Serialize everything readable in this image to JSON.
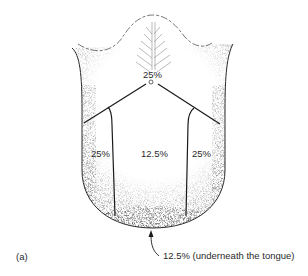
{
  "figure": {
    "panel_label": "(a)",
    "subject": "tongue",
    "regions": [
      {
        "id": "posterior",
        "label": "25%"
      },
      {
        "id": "left-lateral",
        "label": "25%"
      },
      {
        "id": "central-dorsum",
        "label": "12.5%"
      },
      {
        "id": "right-lateral",
        "label": "25%"
      }
    ],
    "callout": {
      "label": "12.5% (underneath the tongue)"
    }
  },
  "colors": {
    "ink": "#1a1a1a",
    "stipple": "#9a9a9a",
    "background": "#ffffff"
  }
}
